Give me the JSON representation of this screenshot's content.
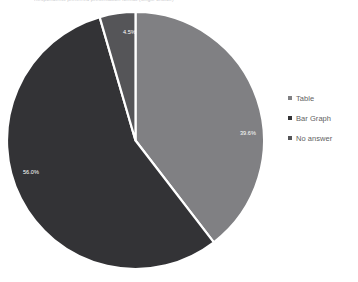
{
  "chart_data": {
    "type": "pie",
    "title": "Respondents preferred presentation format (single choice)",
    "categories": [
      "Table",
      "Bar Graph",
      "No answer"
    ],
    "values": [
      39.6,
      56.0,
      4.5
    ],
    "value_labels": [
      "39.6%",
      "56.0%",
      "4.5%"
    ],
    "colors": [
      "#808083",
      "#333336",
      "#555558"
    ],
    "start_angle_deg": 0,
    "direction": "clockwise",
    "legend_position": "right",
    "grid": false,
    "xlabel": "",
    "ylabel": "",
    "slices": [
      {
        "name": "Table",
        "value": 39.6,
        "label": "39.6%",
        "color": "#808083",
        "label_x": 234,
        "label_y": 124
      },
      {
        "name": "Bar Graph",
        "value": 56.0,
        "label": "56.0%",
        "color": "#333336",
        "label_x": 17,
        "label_y": 163
      },
      {
        "name": "No answer",
        "value": 4.5,
        "label": "4.5%",
        "color": "#555558",
        "label_x": 117,
        "label_y": 23
      }
    ]
  },
  "legend": {
    "items": [
      {
        "label": "Table",
        "color": "#808083"
      },
      {
        "label": "Bar Graph",
        "color": "#333336"
      },
      {
        "label": "No answer",
        "color": "#555558"
      }
    ]
  }
}
